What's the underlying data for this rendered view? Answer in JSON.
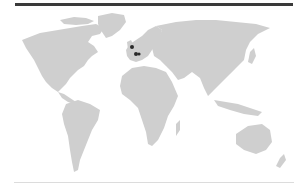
{
  "map": {
    "type": "world-map",
    "land_color": "#cfcfcf",
    "background_color": "#ffffff",
    "rule_color": "#3a3a3a",
    "markers": [
      {
        "id": "marker-1",
        "region": "United Kingdom",
        "x": 132,
        "y": 47,
        "color": "#2a2a2a"
      },
      {
        "id": "marker-2",
        "region": "Western Europe (Benelux/Germany)",
        "x": 136,
        "y": 54,
        "color": "#2a2a2a"
      },
      {
        "id": "marker-3",
        "region": "Western Europe (Germany)",
        "x": 139,
        "y": 54,
        "color": "#2a2a2a"
      }
    ]
  }
}
